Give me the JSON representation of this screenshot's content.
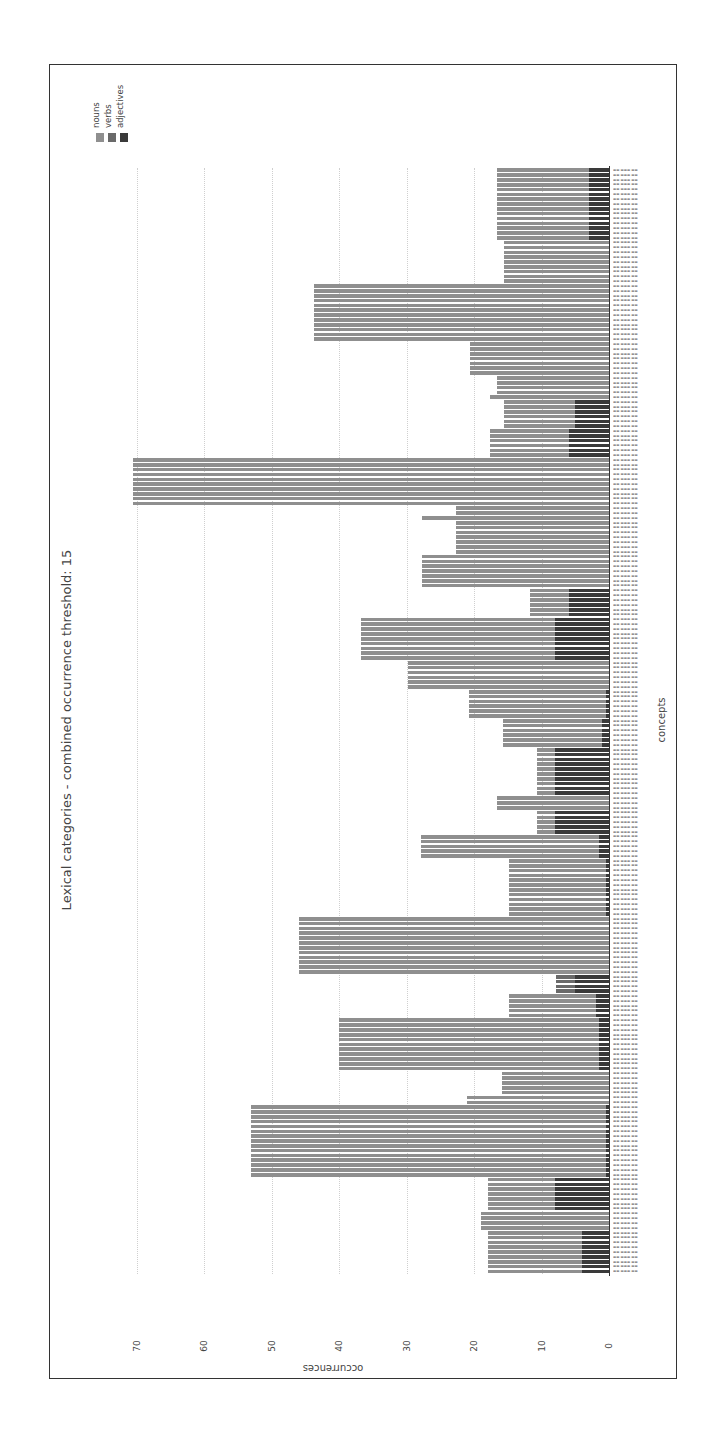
{
  "chart_data": {
    "type": "bar",
    "orientation": "rotated-90",
    "stacked": true,
    "title": "Lexical categories - combined occurrence threshold: 15",
    "xlabel": "concepts",
    "ylabel": "occurrences",
    "ylim": [
      0,
      75
    ],
    "yticks": [
      0,
      10,
      20,
      30,
      40,
      50,
      60,
      70
    ],
    "grid": true,
    "legend": {
      "position": "top-left (rotated)",
      "entries": [
        {
          "name": "nouns",
          "color": "#8f8f8f"
        },
        {
          "name": "verbs",
          "color": "#6a6a6a"
        },
        {
          "name": "adjectives",
          "color": "#3a3a3a"
        }
      ]
    },
    "categories_note": "concept labels are illegible in the source image",
    "bar_groups": [
      {
        "count": 15,
        "nouns": 13.6,
        "verbs": 0,
        "adjectives": 3
      },
      {
        "count": 9,
        "nouns": 15.5,
        "verbs": 0,
        "adjectives": 0
      },
      {
        "count": 12,
        "nouns": 43.7,
        "verbs": 0,
        "adjectives": 0
      },
      {
        "count": 7,
        "nouns": 20.6,
        "verbs": 0,
        "adjectives": 0
      },
      {
        "count": 4,
        "nouns": 16.6,
        "verbs": 0,
        "adjectives": 0
      },
      {
        "count": 1,
        "nouns": 17.6,
        "verbs": 0,
        "adjectives": 0
      },
      {
        "count": 6,
        "nouns": 10.5,
        "verbs": 0,
        "adjectives": 5
      },
      {
        "count": 6,
        "nouns": 11.6,
        "verbs": 0,
        "adjectives": 6
      },
      {
        "count": 10,
        "nouns": 70.5,
        "verbs": 0,
        "adjectives": 0
      },
      {
        "count": 2,
        "nouns": 22.7,
        "verbs": 0,
        "adjectives": 0
      },
      {
        "count": 1,
        "nouns": 27.7,
        "verbs": 0,
        "adjectives": 0
      },
      {
        "count": 7,
        "nouns": 22.7,
        "verbs": 0,
        "adjectives": 0
      },
      {
        "count": 7,
        "nouns": 27.7,
        "verbs": 0,
        "adjectives": 0
      },
      {
        "count": 6,
        "nouns": 5.7,
        "verbs": 0,
        "adjectives": 6
      },
      {
        "count": 9,
        "nouns": 28.7,
        "verbs": 0,
        "adjectives": 8
      },
      {
        "count": 6,
        "nouns": 29.8,
        "verbs": 0,
        "adjectives": 0
      },
      {
        "count": 6,
        "nouns": 20.3,
        "verbs": 0,
        "adjectives": 0.5
      },
      {
        "count": 6,
        "nouns": 14.7,
        "verbs": 0,
        "adjectives": 1
      },
      {
        "count": 10,
        "nouns": 2.7,
        "verbs": 0,
        "adjectives": 8
      },
      {
        "count": 3,
        "nouns": 16.6,
        "verbs": 0,
        "adjectives": 0
      },
      {
        "count": 5,
        "nouns": 2.7,
        "verbs": 0,
        "adjectives": 8
      },
      {
        "count": 5,
        "nouns": 26.3,
        "verbs": 0,
        "adjectives": 1.5
      },
      {
        "count": 12,
        "nouns": 14.3,
        "verbs": 0,
        "adjectives": 0.5
      },
      {
        "count": 12,
        "nouns": 46.0,
        "verbs": 0,
        "adjectives": 0
      },
      {
        "count": 4,
        "nouns": 0,
        "verbs": 2.8,
        "adjectives": 5
      },
      {
        "count": 5,
        "nouns": 12.8,
        "verbs": 0,
        "adjectives": 2
      },
      {
        "count": 11,
        "nouns": 38.5,
        "verbs": 0,
        "adjectives": 1.5
      },
      {
        "count": 5,
        "nouns": 15.8,
        "verbs": 0,
        "adjectives": 0
      },
      {
        "count": 2,
        "nouns": 21.0,
        "verbs": 0,
        "adjectives": 0
      },
      {
        "count": 15,
        "nouns": 52.5,
        "verbs": 0,
        "adjectives": 0.5
      },
      {
        "count": 7,
        "nouns": 10.0,
        "verbs": 0,
        "adjectives": 8
      },
      {
        "count": 4,
        "nouns": 19.0,
        "verbs": 0,
        "adjectives": 0
      },
      {
        "count": 9,
        "nouns": 14.0,
        "verbs": 0,
        "adjectives": 4
      }
    ]
  },
  "labels": {
    "title": "Lexical categories - combined occurrence threshold: 15",
    "xlabel": "concepts",
    "ylabel": "occurrences",
    "legend_nouns": "nouns",
    "legend_verbs": "verbs",
    "legend_adjectives": "adjectives",
    "ticks": [
      "0",
      "10",
      "20",
      "30",
      "40",
      "50",
      "60",
      "70"
    ]
  }
}
